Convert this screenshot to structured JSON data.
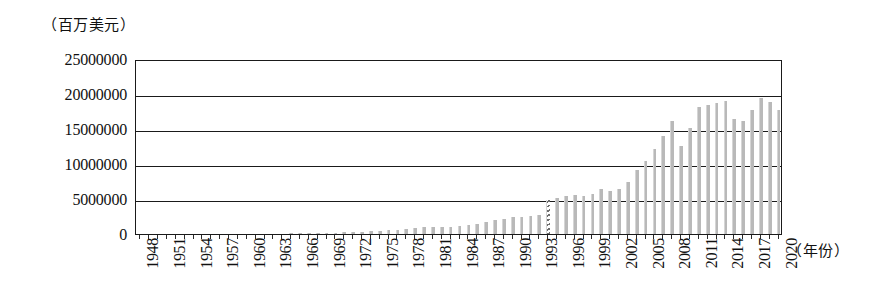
{
  "chart_data": {
    "type": "bar",
    "title": "",
    "subtitle": "",
    "ylabel": "（百万美元）",
    "xlabel": "（年份）",
    "ylim": [
      0,
      25000000
    ],
    "grid": true,
    "legend": null,
    "bar_color": "#b9b9b9",
    "axis_color": "#1a1a1a",
    "y_ticks": [
      0,
      5000000,
      10000000,
      15000000,
      20000000,
      25000000
    ],
    "y_tick_labels": [
      "0",
      "5000000",
      "10000000",
      "15000000",
      "20000000",
      "25000000"
    ],
    "x_tick_labels": [
      "1948",
      "1951",
      "1954",
      "1957",
      "1960",
      "1963",
      "1966",
      "1969",
      "1972",
      "1975",
      "1978",
      "1981",
      "1984",
      "1987",
      "1990",
      "1993",
      "1996",
      "1999",
      "2002",
      "2005",
      "2008",
      "2011",
      "2014",
      "2017",
      "2020"
    ],
    "x_tick_step": 3,
    "annotations": [
      {
        "type": "axis-break",
        "at_category": "1994",
        "note": "hatched/dashed bar marking series discontinuity"
      }
    ],
    "categories": [
      "1948",
      "1949",
      "1950",
      "1951",
      "1952",
      "1953",
      "1954",
      "1955",
      "1956",
      "1957",
      "1958",
      "1959",
      "1960",
      "1961",
      "1962",
      "1963",
      "1964",
      "1965",
      "1966",
      "1967",
      "1968",
      "1969",
      "1970",
      "1971",
      "1972",
      "1973",
      "1974",
      "1975",
      "1976",
      "1977",
      "1978",
      "1979",
      "1980",
      "1981",
      "1982",
      "1983",
      "1984",
      "1985",
      "1986",
      "1987",
      "1988",
      "1989",
      "1990",
      "1991",
      "1992",
      "1993",
      "1994",
      "1995",
      "1996",
      "1997",
      "1998",
      "1999",
      "2000",
      "2001",
      "2002",
      "2003",
      "2004",
      "2005",
      "2006",
      "2007",
      "2008",
      "2009",
      "2010",
      "2011",
      "2012",
      "2013",
      "2014",
      "2015",
      "2016",
      "2017",
      "2018",
      "2019",
      "2020"
    ],
    "values": [
      0,
      0,
      0,
      0,
      0,
      0,
      0,
      0,
      0,
      0,
      0,
      0,
      0,
      0,
      0,
      0,
      0,
      60000,
      90000,
      120000,
      150000,
      170000,
      200000,
      230000,
      260000,
      320000,
      420000,
      470000,
      530000,
      600000,
      700000,
      880000,
      1000000,
      1050000,
      1000000,
      1050000,
      1150000,
      1250000,
      1400000,
      1700000,
      2000000,
      2150000,
      2400000,
      2450000,
      2600000,
      2750000,
      4850000,
      5150000,
      5400000,
      5550000,
      5500000,
      5750000,
      6450000,
      6150000,
      6500000,
      7500000,
      9100000,
      10500000,
      12200000,
      14000000,
      16200000,
      12600000,
      15200000,
      18200000,
      18400000,
      18700000,
      19000000,
      16500000,
      16200000,
      17700000,
      19400000,
      18800000,
      17700000
    ]
  }
}
